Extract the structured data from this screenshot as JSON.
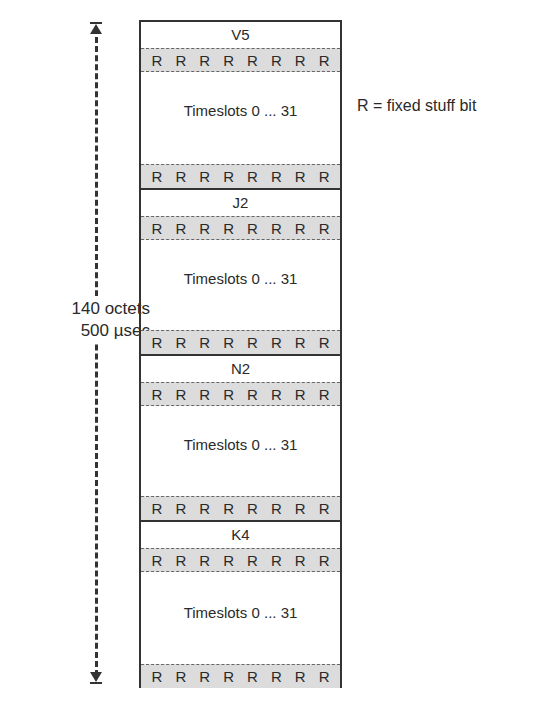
{
  "legend": "R = fixed stuff bit",
  "dimension": {
    "line1": "140 octets",
    "line2": "500 µsec"
  },
  "r_bit": "R",
  "bits_per_row": 8,
  "blocks": [
    {
      "header": "V5",
      "timeslots": "Timeslots 0 ... 31"
    },
    {
      "header": "J2",
      "timeslots": "Timeslots 0 ... 31"
    },
    {
      "header": "N2",
      "timeslots": "Timeslots 0 ... 31"
    },
    {
      "header": "K4",
      "timeslots": "Timeslots 0 ... 31"
    }
  ],
  "colors": {
    "stuff_row_fill": "#dcdcdc",
    "border": "#333333",
    "text": "#2a2a2a"
  }
}
